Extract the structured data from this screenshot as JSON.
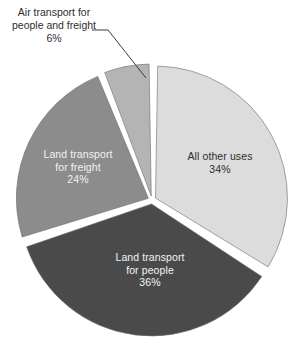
{
  "chart_data": {
    "type": "pie",
    "title": "",
    "subtitle": "",
    "xlabel": "",
    "ylabel": "",
    "legend_position": "none",
    "grid": false,
    "units": "percent",
    "total": 100,
    "categories": [
      "All other uses",
      "Land transport for people",
      "Land transport for freight",
      "Air transport for people and freight"
    ],
    "values": [
      34,
      36,
      24,
      6
    ],
    "slices": [
      {
        "id": "all-other-uses",
        "label": "All other uses",
        "label_lines": [
          "All other uses"
        ],
        "value": 34,
        "value_text": "34%",
        "color": "#dcdcdc",
        "text_color": "#2e2e2e",
        "label_placement": "inside"
      },
      {
        "id": "land-transport-people",
        "label": "Land transport for people",
        "label_lines": [
          "Land transport",
          "for people"
        ],
        "value": 36,
        "value_text": "36%",
        "color": "#4a4a4a",
        "text_color": "#f2f2f2",
        "label_placement": "inside"
      },
      {
        "id": "land-transport-freight",
        "label": "Land transport for freight",
        "label_lines": [
          "Land transport",
          "for freight"
        ],
        "value": 24,
        "value_text": "24%",
        "color": "#8c8c8c",
        "text_color": "#f2f2f2",
        "label_placement": "inside"
      },
      {
        "id": "air-transport",
        "label": "Air transport for people and freight",
        "label_lines": [
          "Air transport for",
          "people and freight"
        ],
        "value": 6,
        "value_text": "6%",
        "color": "#b4b4b4",
        "text_color": "#2e2e2e",
        "label_placement": "callout"
      }
    ]
  },
  "colors": {
    "background": "#ffffff",
    "slice_outline": "#6b6b6b",
    "leader_line": "#3a3a3a",
    "separator": "#ffffff"
  }
}
